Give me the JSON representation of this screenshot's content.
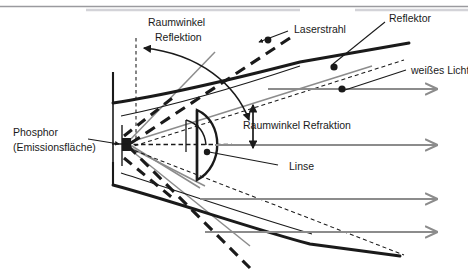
{
  "figure": {
    "background_color": "#ffffff",
    "top_rule_color": "#9a9a9e",
    "stroke_dark": "#1a1a1a",
    "stroke_gray": "#8c8c8c",
    "width": 468,
    "height": 272
  },
  "labels": {
    "raumwinkel_reflektion_line1": "Raumwinkel",
    "raumwinkel_reflektion_line2": "Reflektion",
    "laserstrahl": "Laserstrahl",
    "reflektor": "Reflektor",
    "weisses_licht": "weißes Licht",
    "raumwinkel_refraktion": "Raumwinkel Refraktion",
    "linse": "Linse",
    "phosphor_line1": "Phosphor",
    "phosphor_line2": "(Emissionsfläche)"
  },
  "components": {
    "phosphor_marker": "phosphor-emission-square",
    "lens": "plano-convex-lens",
    "reflector_upper": "upper-reflector-curve",
    "reflector_lower": "lower-reflector-curve",
    "laser_beam": "dashed-laser-beam",
    "white_light_rays": "gray-parallel-output-rays",
    "solid_angle_reflection_arc": "curved-double-arrow-reflection",
    "solid_angle_refraction_arrow": "vertical-double-arrow-refraction"
  },
  "ray_counts": {
    "white_light_arrows": 3,
    "dotted_ray_markers": 3
  }
}
